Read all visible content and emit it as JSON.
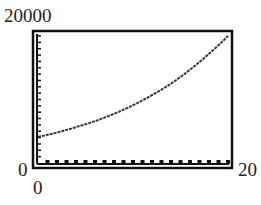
{
  "chart_data": {
    "type": "line",
    "title": "",
    "xlabel": "",
    "ylabel": "",
    "xlim": [
      0,
      20
    ],
    "ylim": [
      0,
      20000
    ],
    "tick_labels": {
      "y_max": "20000",
      "y_min": "0",
      "x_min": "0",
      "x_max": "20"
    },
    "x_ticks_count": 20,
    "y_ticks_count": 20,
    "grid": false,
    "series": [
      {
        "name": "exponential growth",
        "x": [
          0,
          2,
          4,
          6,
          8,
          10,
          12,
          14,
          16,
          18,
          20
        ],
        "values": [
          4100,
          4800,
          5650,
          6600,
          7750,
          9100,
          10700,
          12500,
          14700,
          17200,
          20000
        ]
      }
    ],
    "colors": {
      "line": "#333333",
      "frame": "#111111"
    }
  }
}
